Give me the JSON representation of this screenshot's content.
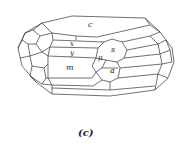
{
  "figure": {
    "type": "crystal-drawing",
    "caption": "(c)",
    "face_labels": {
      "c": "c",
      "x": "x",
      "y": "y",
      "m": "m",
      "mu": "μ",
      "s": "s",
      "a": "a"
    },
    "line_color": "#333333",
    "background": "#ffffff"
  }
}
